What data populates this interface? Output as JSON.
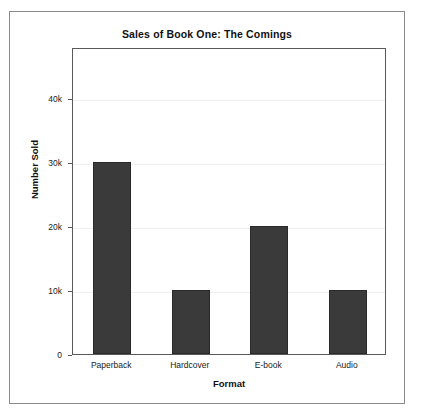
{
  "chart_data": {
    "type": "bar",
    "title": "Sales of Book One: The Comings",
    "xlabel": "Format",
    "ylabel": "Number Sold",
    "categories": [
      "Paperback",
      "Hardcover",
      "E-book",
      "Audio"
    ],
    "values": [
      30000,
      10000,
      20000,
      10000
    ],
    "series": [
      {
        "name": "Number Sold",
        "values": [
          30000,
          10000,
          20000,
          10000
        ]
      }
    ],
    "ylim": [
      0,
      48000
    ],
    "yticks": [
      0,
      10000,
      20000,
      30000,
      40000
    ],
    "ytick_labels": [
      "0",
      "10k",
      "20k",
      "30k",
      "40k"
    ],
    "xtick_labels": [
      "Paperback",
      "Hardcover",
      "E-book",
      "Audio"
    ],
    "grid": true,
    "legend": null,
    "bar_color": "#3a3a3a",
    "bar_edge_color": "#2a2a2a",
    "gridline_color": "#f0f0f0",
    "axis_color": "#5a5a5a",
    "frame_color": "#8a8a8a",
    "background_color": "#ffffff"
  }
}
